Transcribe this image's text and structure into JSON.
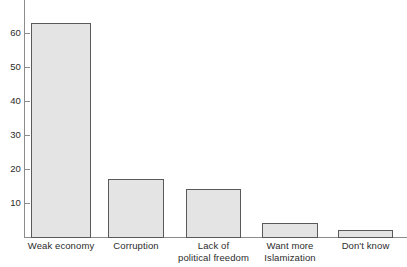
{
  "chart_data": {
    "type": "bar",
    "title": "",
    "subtitle": "",
    "xlabel": "",
    "ylabel": "",
    "categories": [
      "Weak economy",
      "Corruption",
      "Lack of political freedom",
      "Want more Islamization",
      "Don't know"
    ],
    "category_lines": [
      [
        "Weak economy",
        ""
      ],
      [
        "Corruption",
        ""
      ],
      [
        "Lack of",
        "political freedom"
      ],
      [
        "Want more",
        "Islamization"
      ],
      [
        "Don't know",
        ""
      ]
    ],
    "values": [
      63,
      17,
      14,
      4,
      2
    ],
    "ylim": [
      0,
      66
    ],
    "yticks": [
      10,
      20,
      30,
      40,
      50,
      60
    ],
    "ytick_labels": [
      "10",
      "20",
      "30",
      "40",
      "50",
      "60"
    ],
    "grid": false,
    "legend": null,
    "legend_position": "none",
    "colors": {
      "bar_fill": "#e4e4e4",
      "bar_stroke": "#5a5a5a",
      "axis": "#8c8c8c",
      "text": "#2b2b2b",
      "background": "#ffffff"
    }
  },
  "geometry": {
    "baseline_y": 237,
    "px_per_unit": 3.4,
    "bars": [
      {
        "left": 31,
        "width": 60
      },
      {
        "left": 108,
        "width": 56
      },
      {
        "left": 186,
        "width": 55
      },
      {
        "left": 262,
        "width": 56
      },
      {
        "left": 338,
        "width": 55
      }
    ]
  }
}
